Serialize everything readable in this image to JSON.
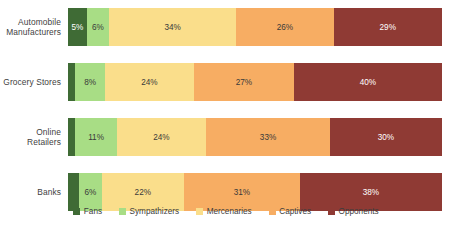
{
  "chart_data": {
    "type": "bar",
    "subtype": "stacked-horizontal-100",
    "title": "",
    "xlabel": "",
    "ylabel": "",
    "xlim": [
      0,
      100
    ],
    "grid": false,
    "legend_position": "bottom",
    "categories": [
      "Automobile Manufacturers",
      "Grocery Stores",
      "Online Retailers",
      "Banks"
    ],
    "series": [
      {
        "name": "Fans",
        "color": "#3f6b35",
        "values": [
          5,
          2,
          2,
          3
        ],
        "labels": [
          "5%",
          "",
          "",
          ""
        ]
      },
      {
        "name": "Sympathizers",
        "color": "#a8dd85",
        "values": [
          6,
          8,
          11,
          6
        ],
        "labels": [
          "6%",
          "8%",
          "11%",
          "6%"
        ]
      },
      {
        "name": "Mercenaries",
        "color": "#fade8b",
        "values": [
          34,
          24,
          24,
          22
        ],
        "labels": [
          "34%",
          "24%",
          "24%",
          "22%"
        ]
      },
      {
        "name": "Captives",
        "color": "#f7ad63",
        "values": [
          26,
          27,
          33,
          31
        ],
        "labels": [
          "26%",
          "27%",
          "33%",
          "31%"
        ]
      },
      {
        "name": "Opponents",
        "color": "#8f3a34",
        "values": [
          29,
          40,
          30,
          38
        ],
        "labels": [
          "29%",
          "40%",
          "30%",
          "38%"
        ]
      }
    ]
  },
  "rows": [
    {
      "label_line1": "Automobile",
      "label_line2": "Manufacturers",
      "segments": [
        {
          "series": "Fans",
          "value": 5,
          "label": "5%",
          "color": "#3f6b35",
          "light_text": true
        },
        {
          "series": "Sympathizers",
          "value": 6,
          "label": "6%",
          "color": "#a8dd85",
          "light_text": false
        },
        {
          "series": "Mercenaries",
          "value": 34,
          "label": "34%",
          "color": "#fade8b",
          "light_text": false
        },
        {
          "series": "Captives",
          "value": 26,
          "label": "26%",
          "color": "#f7ad63",
          "light_text": false
        },
        {
          "series": "Opponents",
          "value": 29,
          "label": "29%",
          "color": "#8f3a34",
          "light_text": true
        }
      ]
    },
    {
      "label_line1": "Grocery Stores",
      "label_line2": "",
      "segments": [
        {
          "series": "Fans",
          "value": 2,
          "label": "",
          "color": "#3f6b35",
          "light_text": true
        },
        {
          "series": "Sympathizers",
          "value": 8,
          "label": "8%",
          "color": "#a8dd85",
          "light_text": false
        },
        {
          "series": "Mercenaries",
          "value": 24,
          "label": "24%",
          "color": "#fade8b",
          "light_text": false
        },
        {
          "series": "Captives",
          "value": 27,
          "label": "27%",
          "color": "#f7ad63",
          "light_text": false
        },
        {
          "series": "Opponents",
          "value": 40,
          "label": "40%",
          "color": "#8f3a34",
          "light_text": true
        }
      ]
    },
    {
      "label_line1": "Online Retailers",
      "label_line2": "",
      "segments": [
        {
          "series": "Fans",
          "value": 2,
          "label": "",
          "color": "#3f6b35",
          "light_text": true
        },
        {
          "series": "Sympathizers",
          "value": 11,
          "label": "11%",
          "color": "#a8dd85",
          "light_text": false
        },
        {
          "series": "Mercenaries",
          "value": 24,
          "label": "24%",
          "color": "#fade8b",
          "light_text": false
        },
        {
          "series": "Captives",
          "value": 33,
          "label": "33%",
          "color": "#f7ad63",
          "light_text": false
        },
        {
          "series": "Opponents",
          "value": 30,
          "label": "30%",
          "color": "#8f3a34",
          "light_text": true
        }
      ]
    },
    {
      "label_line1": "Banks",
      "label_line2": "",
      "segments": [
        {
          "series": "Fans",
          "value": 3,
          "label": "",
          "color": "#3f6b35",
          "light_text": true
        },
        {
          "series": "Sympathizers",
          "value": 6,
          "label": "6%",
          "color": "#a8dd85",
          "light_text": false
        },
        {
          "series": "Mercenaries",
          "value": 22,
          "label": "22%",
          "color": "#fade8b",
          "light_text": false
        },
        {
          "series": "Captives",
          "value": 31,
          "label": "31%",
          "color": "#f7ad63",
          "light_text": false
        },
        {
          "series": "Opponents",
          "value": 38,
          "label": "38%",
          "color": "#8f3a34",
          "light_text": true
        }
      ]
    }
  ],
  "legend": [
    {
      "label": "Fans",
      "color": "#3f6b35"
    },
    {
      "label": "Sympathizers",
      "color": "#a8dd85"
    },
    {
      "label": "Mercenaries",
      "color": "#fade8b"
    },
    {
      "label": "Captives",
      "color": "#f7ad63"
    },
    {
      "label": "Opponents",
      "color": "#8f3a34"
    }
  ]
}
